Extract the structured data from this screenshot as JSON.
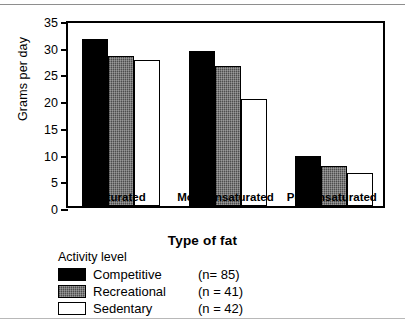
{
  "chart_data": {
    "type": "bar",
    "title": "",
    "xlabel": "Type of fat",
    "ylabel": "Grams per day",
    "categories": [
      "Saturated",
      "Monounsaturated",
      "Polyunsaturated"
    ],
    "series": [
      {
        "name": "Competitive",
        "n": 85,
        "values": [
          31.2,
          29.0,
          9.4
        ],
        "color": "#000000",
        "fill": "solid-black"
      },
      {
        "name": "Recreational",
        "n": 41,
        "values": [
          28.0,
          26.2,
          7.5
        ],
        "color": "#6e6e6e",
        "fill": "gray-textured"
      },
      {
        "name": "Sedentary",
        "n": 42,
        "values": [
          27.4,
          20.0,
          6.1
        ],
        "color": "#ffffff",
        "fill": "white-outline"
      }
    ],
    "ylim": [
      0,
      35
    ],
    "yticks": [
      0,
      5,
      10,
      15,
      20,
      25,
      30,
      35
    ],
    "ytick_labels": [
      "0",
      "5",
      "10",
      "15",
      "20",
      "25",
      "30",
      "35"
    ],
    "grid": false,
    "legend_position": "below-plot-left",
    "axis_frame": true
  },
  "legend": {
    "title": "Activity level",
    "entries": [
      {
        "label": "Competitive",
        "count_text": "(n= 85)"
      },
      {
        "label": "Recreational",
        "count_text": "(n = 41)"
      },
      {
        "label": "Sedentary",
        "count_text": "(n = 42)"
      }
    ]
  }
}
